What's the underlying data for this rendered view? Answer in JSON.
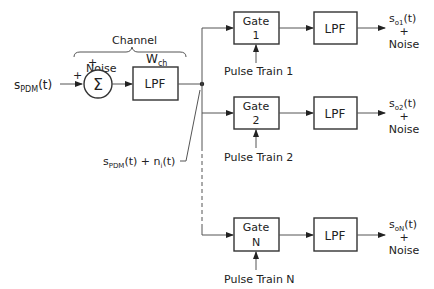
{
  "diagram": {
    "input_signal": {
      "main": "s",
      "sub": "PDM",
      "tail": "(t)"
    },
    "channel_label": "Channel",
    "noise_label": "Noise",
    "plus_sign": "+",
    "summer_symbol": "Σ",
    "channel_filter": {
      "label": "LPF",
      "bandwidth": {
        "main": "W",
        "sub": "ch"
      }
    },
    "received_signal": {
      "s": "s",
      "s_sub": "PDM",
      "mid": "(t) + n",
      "n_sub": "i",
      "tail": "(t)"
    },
    "channels": [
      {
        "gate_title": "Gate",
        "gate_index": "1",
        "filter": "LPF",
        "pulse_train": "Pulse Train 1",
        "output": {
          "main": "s",
          "sub": "o1",
          "tail": "(t)"
        },
        "plus": "+",
        "noise": "Noise"
      },
      {
        "gate_title": "Gate",
        "gate_index": "2",
        "filter": "LPF",
        "pulse_train": "Pulse Train 2",
        "output": {
          "main": "s",
          "sub": "o2",
          "tail": "(t)"
        },
        "plus": "+",
        "noise": "Noise"
      },
      {
        "gate_title": "Gate",
        "gate_index": "N",
        "filter": "LPF",
        "pulse_train": "Pulse Train N",
        "output": {
          "main": "s",
          "sub": "oN",
          "tail": "(t)"
        },
        "plus": "+",
        "noise": "Noise"
      }
    ]
  }
}
